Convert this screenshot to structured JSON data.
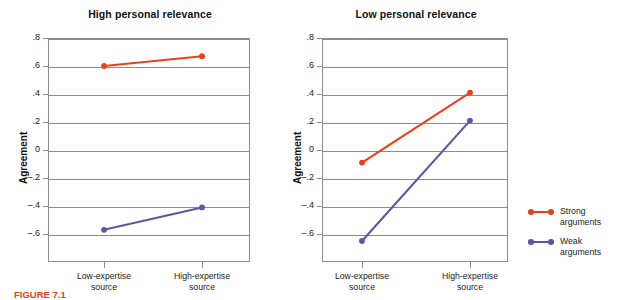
{
  "figure": {
    "caption": "FIGURE 7.1"
  },
  "legend": {
    "position": "right",
    "items": [
      {
        "label": "Strong\narguments",
        "color": "#E8401C",
        "name": "strong-arguments"
      },
      {
        "label": "Weak\narguments",
        "color": "#5B57A6",
        "name": "weak-arguments"
      }
    ]
  },
  "chart_data": [
    {
      "type": "line",
      "title": "High personal relevance",
      "xlabel": "",
      "ylabel": "Agreement",
      "categories": [
        "Low-expertise\nsource",
        "High-expertise\nsource"
      ],
      "yticks": [
        ".8",
        ".6",
        ".4",
        ".2",
        "0",
        "–.2",
        "–.4",
        "–.6"
      ],
      "ytick_values": [
        0.8,
        0.6,
        0.4,
        0.2,
        0,
        -0.2,
        -0.4,
        -0.6
      ],
      "ylim": [
        -0.8,
        0.8
      ],
      "grid": true,
      "series": [
        {
          "name": "Strong arguments",
          "values": [
            0.6,
            0.67
          ],
          "color": "#E8401C"
        },
        {
          "name": "Weak arguments",
          "values": [
            -0.57,
            -0.41
          ],
          "color": "#5B57A6"
        }
      ]
    },
    {
      "type": "line",
      "title": "Low personal relevance",
      "xlabel": "",
      "ylabel": "Agreement",
      "categories": [
        "Low-expertise\nsource",
        "High-expertise\nsource"
      ],
      "yticks": [
        ".8",
        ".6",
        ".4",
        ".2",
        "0",
        "–.2",
        "–.4",
        "–.6"
      ],
      "ytick_values": [
        0.8,
        0.6,
        0.4,
        0.2,
        0,
        -0.2,
        -0.4,
        -0.6
      ],
      "ylim": [
        -0.8,
        0.8
      ],
      "grid": true,
      "series": [
        {
          "name": "Strong arguments",
          "values": [
            -0.09,
            0.41
          ],
          "color": "#E8401C"
        },
        {
          "name": "Weak arguments",
          "values": [
            -0.65,
            0.21
          ],
          "color": "#5B57A6"
        }
      ]
    }
  ]
}
